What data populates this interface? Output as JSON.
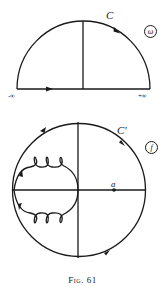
{
  "figure": {
    "caption_prefix": "Fig.",
    "caption_number": "61"
  },
  "upper_diagram": {
    "contour_label": "C",
    "plane_label": "ω",
    "left_end_label": "-∞",
    "right_end_label": "+∞",
    "shape": "upper semicircle over real axis with vertical axis; arrows on arc and baseline"
  },
  "lower_diagram": {
    "contour_label": "C'",
    "plane_label": "f",
    "point_label": "a",
    "shape": "circle with axes; looping curve with three loops above and below the horizontal axis on the left side"
  },
  "colors": {
    "ink": "#1a1a1a",
    "background": "#ffffff"
  }
}
